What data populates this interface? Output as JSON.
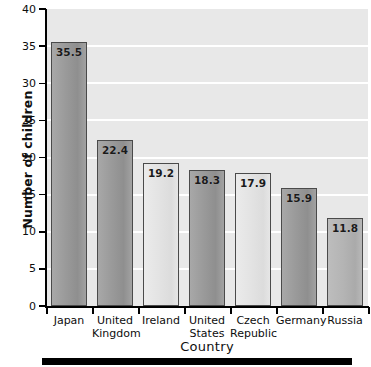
{
  "chart_data": {
    "type": "bar",
    "title": "",
    "xlabel": "Country",
    "ylabel": "Number of children",
    "categories": [
      "Japan",
      "United Kingdom",
      "Ireland",
      "United States",
      "Czech Republic",
      "Germany",
      "Russia"
    ],
    "values": [
      35.5,
      22.4,
      19.2,
      18.3,
      17.9,
      15.9,
      11.8
    ],
    "value_labels": [
      "35.5",
      "22.4",
      "19.2",
      "18.3",
      "17.9",
      "15.9",
      "11.8"
    ],
    "ylim": [
      0,
      40
    ],
    "ytick_labels": [
      "0",
      "5",
      "10",
      "15",
      "20",
      "25",
      "30",
      "35",
      "40"
    ],
    "ytick_values": [
      0,
      5,
      10,
      15,
      20,
      25,
      30,
      35,
      40
    ],
    "grid": "horizontal",
    "legend": "none",
    "bar_shades": [
      "dark",
      "dark",
      "light",
      "dark",
      "light",
      "dark",
      "medium"
    ],
    "colors": {
      "plot_background": "#e8e8e8",
      "gridline": "#ffffff",
      "bar_dark": "#9a9a9a",
      "bar_light": "#e3e3e3",
      "bar_medium": "#b4b4b4",
      "bar_border": "#4a4a4a",
      "axis": "#000000",
      "text": "#0d0d0d",
      "page_background": "#ffffff",
      "bottom_rule": "#000000"
    },
    "category_label_lines": [
      [
        "Japan"
      ],
      [
        "United",
        "Kingdom"
      ],
      [
        "Ireland"
      ],
      [
        "United",
        "States"
      ],
      [
        "Czech",
        "Republic"
      ],
      [
        "Germany"
      ],
      [
        "Russia"
      ]
    ]
  }
}
